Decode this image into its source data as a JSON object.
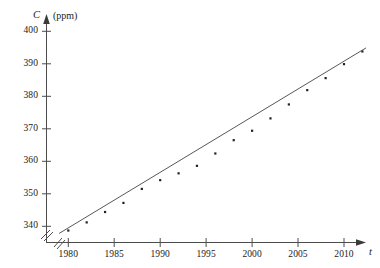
{
  "chart_data": {
    "type": "scatter",
    "title": "",
    "xlabel": "t",
    "ylabel": "C",
    "ylabel_unit": "(ppm)",
    "xlim": [
      1978.2,
      2013.0
    ],
    "ylim": [
      336.0,
      402.0
    ],
    "grid": false,
    "legend": null,
    "axis_break_x": true,
    "axis_break_y": true,
    "xticks": [
      1980,
      1985,
      1990,
      1995,
      2000,
      2005,
      2010
    ],
    "xtick_labels": [
      "1980",
      "1985",
      "1990",
      "1995",
      "2000",
      "2005",
      "2010"
    ],
    "yticks": [
      340,
      350,
      360,
      370,
      380,
      390,
      400
    ],
    "ytick_labels": [
      "340",
      "350",
      "360",
      "370",
      "380",
      "390",
      "400"
    ],
    "series": [
      {
        "name": "CO2 concentration",
        "type": "scatter",
        "marker": "dot",
        "color": "#222222",
        "x": [
          1980,
          1982,
          1984,
          1986,
          1988,
          1990,
          1992,
          1994,
          1996,
          1998,
          2000,
          2002,
          2004,
          2006,
          2008,
          2010,
          2012
        ],
        "y": [
          338.7,
          341.2,
          344.4,
          347.2,
          351.5,
          354.2,
          356.3,
          358.6,
          362.4,
          366.5,
          369.4,
          373.2,
          377.5,
          381.9,
          385.6,
          389.9,
          393.8
        ]
      },
      {
        "name": "regression line",
        "type": "line",
        "color": "#444444",
        "x": [
          1979.0,
          2012.4
        ],
        "y": [
          337.8,
          394.9
        ]
      }
    ]
  },
  "axes": {
    "y_symbol": "C",
    "y_unit": "(ppm)",
    "x_symbol": "t"
  }
}
